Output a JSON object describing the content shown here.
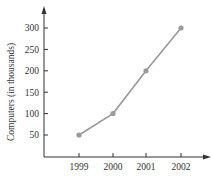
{
  "chart_data": {
    "type": "line",
    "title": "",
    "xlabel": "",
    "ylabel": "Computers (in thousands)",
    "categories": [
      "1999",
      "2000",
      "2001",
      "2002"
    ],
    "series": [
      {
        "name": "Computers",
        "values": [
          50,
          100,
          200,
          300
        ]
      }
    ],
    "yticks": [
      50,
      100,
      150,
      200,
      250,
      300
    ],
    "ylim": [
      0,
      340
    ],
    "grid": false,
    "legend": null
  },
  "colors": {
    "line": "#9a9a9a",
    "marker": "#9a9a9a",
    "axis": "#333333",
    "text": "#333333"
  }
}
